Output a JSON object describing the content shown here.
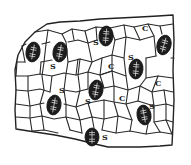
{
  "figure": {
    "labels": {
      "subsidiary": "S",
      "epidermal": "C"
    },
    "stomata": [
      {
        "cx": 33,
        "cy": 52,
        "rx": 7,
        "ry": 10,
        "rot": 10
      },
      {
        "cx": 60,
        "cy": 52,
        "rx": 7,
        "ry": 10,
        "rot": 10
      },
      {
        "cx": 106,
        "cy": 36,
        "rx": 7,
        "ry": 10,
        "rot": 5
      },
      {
        "cx": 164,
        "cy": 45,
        "rx": 7,
        "ry": 10,
        "rot": 15
      },
      {
        "cx": 136,
        "cy": 69,
        "rx": 7,
        "ry": 10,
        "rot": 5
      },
      {
        "cx": 96,
        "cy": 90,
        "rx": 7,
        "ry": 10,
        "rot": 10
      },
      {
        "cx": 54,
        "cy": 105,
        "rx": 7,
        "ry": 10,
        "rot": 10
      },
      {
        "cx": 144,
        "cy": 115,
        "rx": 7,
        "ry": 10,
        "rot": -10
      },
      {
        "cx": 92,
        "cy": 137,
        "rx": 7,
        "ry": 9,
        "rot": 0
      }
    ],
    "s_labels": [
      {
        "x": 93,
        "y": 45
      },
      {
        "x": 50,
        "y": 69
      },
      {
        "x": 59,
        "y": 93
      },
      {
        "x": 128,
        "y": 60
      },
      {
        "x": 85,
        "y": 104
      },
      {
        "x": 149,
        "y": 109
      },
      {
        "x": 102,
        "y": 140
      }
    ],
    "c_labels": [
      {
        "x": 142,
        "y": 31
      },
      {
        "x": 108,
        "y": 69
      },
      {
        "x": 119,
        "y": 101
      },
      {
        "x": 155,
        "y": 86
      }
    ]
  }
}
